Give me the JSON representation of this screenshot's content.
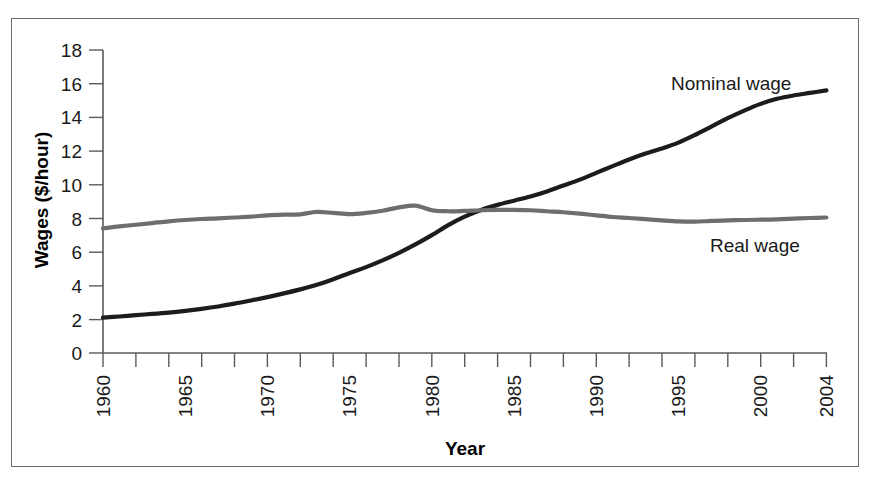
{
  "chart_data": {
    "type": "line",
    "title": "",
    "xlabel": "Year",
    "ylabel": "Wages ($/hour)",
    "xlim": [
      1960,
      2004
    ],
    "ylim": [
      0,
      18
    ],
    "yticks": [
      0,
      2,
      4,
      6,
      8,
      10,
      12,
      14,
      16,
      18
    ],
    "xticks": [
      1960,
      1965,
      1970,
      1975,
      1980,
      1985,
      1990,
      1995,
      2000,
      2004
    ],
    "xtick_labels": [
      "1960",
      "1965",
      "1970",
      "1975",
      "1980",
      "1985",
      "1990",
      "1995",
      "2000",
      "2004"
    ],
    "ytick_labels": [
      "0",
      "2",
      "4",
      "6",
      "8",
      "10",
      "12",
      "14",
      "16",
      "18"
    ],
    "xtick_minor_step": 1,
    "grid": false,
    "legend_position": "inline-annotation",
    "x": [
      1960,
      1961,
      1962,
      1963,
      1964,
      1965,
      1966,
      1967,
      1968,
      1969,
      1970,
      1971,
      1972,
      1973,
      1974,
      1975,
      1976,
      1977,
      1978,
      1979,
      1980,
      1981,
      1982,
      1983,
      1984,
      1985,
      1986,
      1987,
      1988,
      1989,
      1990,
      1991,
      1992,
      1993,
      1994,
      1995,
      1996,
      1997,
      1998,
      1999,
      2000,
      2001,
      2002,
      2003,
      2004
    ],
    "series": [
      {
        "name": "Nominal wage",
        "color": "#1c1c1c",
        "label": "Nominal wage",
        "values": [
          2.1,
          2.17,
          2.25,
          2.32,
          2.4,
          2.5,
          2.62,
          2.76,
          2.93,
          3.12,
          3.32,
          3.54,
          3.78,
          4.05,
          4.38,
          4.75,
          5.1,
          5.5,
          5.95,
          6.45,
          7.0,
          7.6,
          8.1,
          8.5,
          8.8,
          9.05,
          9.3,
          9.6,
          9.95,
          10.3,
          10.7,
          11.1,
          11.5,
          11.85,
          12.15,
          12.5,
          12.95,
          13.45,
          13.95,
          14.4,
          14.8,
          15.1,
          15.3,
          15.45,
          15.6
        ]
      },
      {
        "name": "Real wage",
        "color": "#6e6e6e",
        "label": "Real wage",
        "values": [
          7.4,
          7.52,
          7.62,
          7.72,
          7.82,
          7.9,
          7.96,
          8.0,
          8.05,
          8.1,
          8.18,
          8.22,
          8.24,
          8.38,
          8.32,
          8.25,
          8.32,
          8.45,
          8.65,
          8.75,
          8.48,
          8.42,
          8.44,
          8.48,
          8.5,
          8.5,
          8.48,
          8.42,
          8.36,
          8.28,
          8.18,
          8.08,
          8.02,
          7.95,
          7.88,
          7.82,
          7.8,
          7.85,
          7.88,
          7.9,
          7.92,
          7.94,
          7.98,
          8.02,
          8.05
        ]
      }
    ],
    "annotations": [
      {
        "text": "Nominal wage",
        "x": 1997,
        "y": 15.6
      },
      {
        "text": "Real wage",
        "x": 1996,
        "y": 6.6
      }
    ]
  },
  "axis": {
    "y_title": "Wages ($/hour)",
    "x_title": "Year"
  }
}
